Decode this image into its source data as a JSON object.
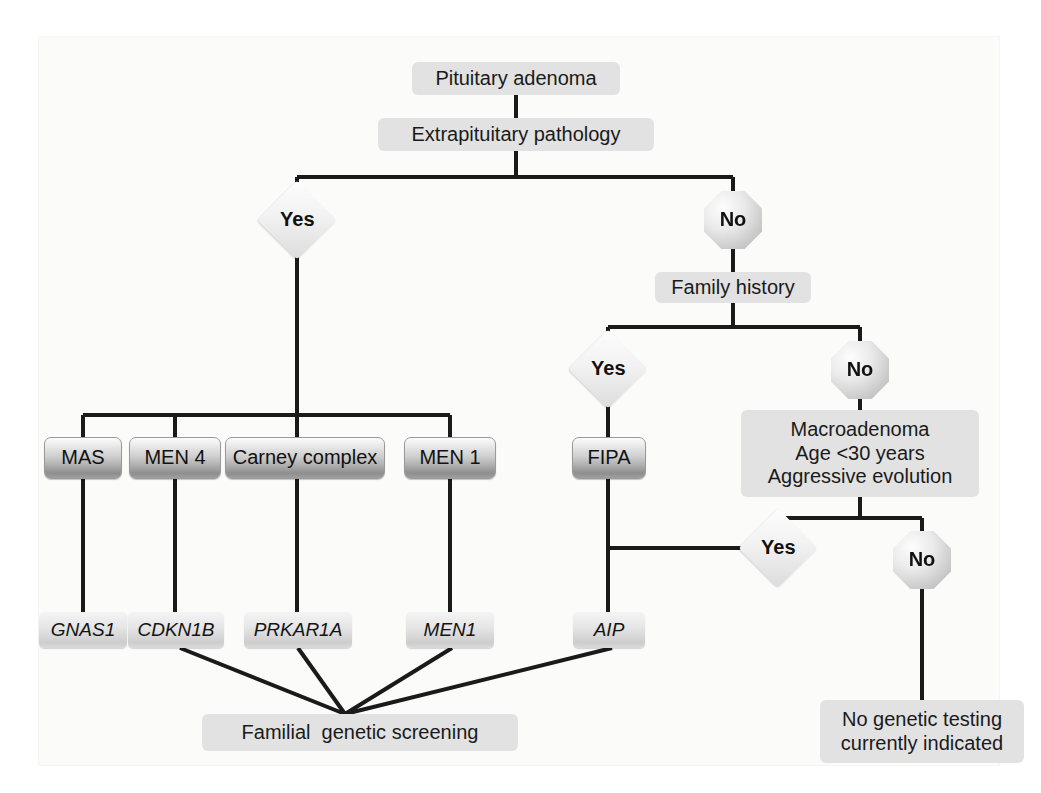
{
  "diagram": {
    "background_color": "#fbfbfa",
    "line_color": "#1a1a1a",
    "nodes": {
      "pituitary_adenoma": "Pituitary adenoma",
      "extrapituitary_pathology": "Extrapituitary pathology",
      "yes_extrapituitary": "Yes",
      "no_extrapituitary": "No",
      "family_history": "Family history",
      "yes_family": "Yes",
      "no_family": "No",
      "mas": "MAS",
      "men4": "MEN 4",
      "carney_complex": "Carney complex",
      "men1": "MEN 1",
      "fipa": "FIPA",
      "macroadenoma_criteria": "Macroadenoma\nAge <30 years\nAggressive evolution",
      "yes_criteria": "Yes",
      "no_criteria": "No",
      "gnas1": "GNAS1",
      "cdkn1b": "CDKN1B",
      "prkar1a": "PRKAR1A",
      "men1_gene": "MEN1",
      "aip": "AIP",
      "familial_genetic_screening": "Familial  genetic screening",
      "no_genetic_testing": "No  genetic testing\ncurrently indicated"
    }
  }
}
